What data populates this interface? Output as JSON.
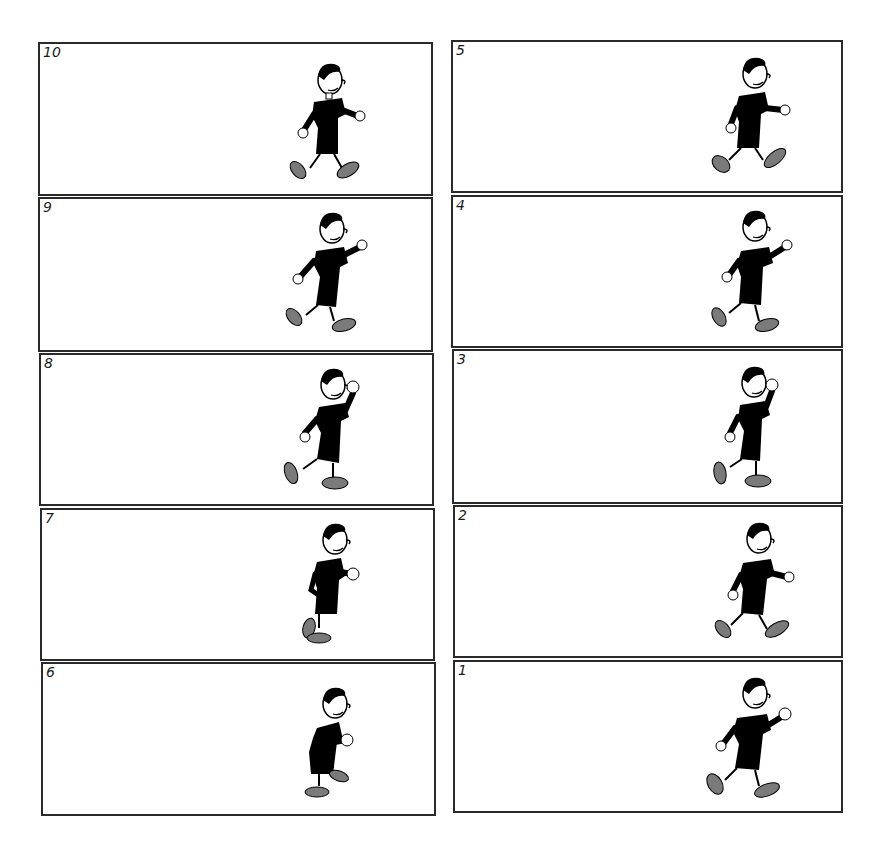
{
  "sheet": {
    "title": "Walk cycle frames",
    "colors": {
      "border": "#2a2a2a",
      "outfit": "#000000",
      "shoe": "#7a7a7a",
      "skin": "#ffffff"
    },
    "left_column": [
      {
        "number": "10",
        "pose": "stride-right-foot-forward"
      },
      {
        "number": "9",
        "pose": "stride-arm-raised"
      },
      {
        "number": "8",
        "pose": "passing-fist-up"
      },
      {
        "number": "7",
        "pose": "contact-hunched"
      },
      {
        "number": "6",
        "pose": "crouch-knee-up"
      }
    ],
    "right_column": [
      {
        "number": "5",
        "pose": "stride-right-foot-forward"
      },
      {
        "number": "4",
        "pose": "stride-arm-reaching"
      },
      {
        "number": "3",
        "pose": "passing-fist-up"
      },
      {
        "number": "2",
        "pose": "stride-walking"
      },
      {
        "number": "1",
        "pose": "stride-wide"
      }
    ]
  }
}
